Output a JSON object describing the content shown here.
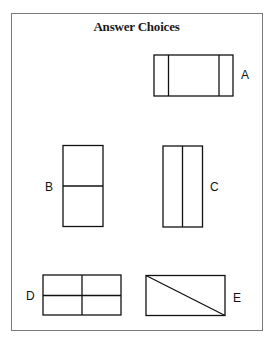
{
  "title": "Answer Choices",
  "choices": [
    {
      "label": "A",
      "description": "Wide rectangle divided by two vertical lines near each end"
    },
    {
      "label": "B",
      "description": "Tall rectangle divided by one horizontal line at the middle"
    },
    {
      "label": "C",
      "description": "Tall rectangle divided by one vertical line at the middle"
    },
    {
      "label": "D",
      "description": "Wide rectangle divided into four quadrants by a cross"
    },
    {
      "label": "E",
      "description": "Wide rectangle divided by a diagonal from top-left to bottom-right"
    }
  ],
  "colors": {
    "stroke": "#111111",
    "frame": "#7a7a7a",
    "background": "#ffffff"
  }
}
